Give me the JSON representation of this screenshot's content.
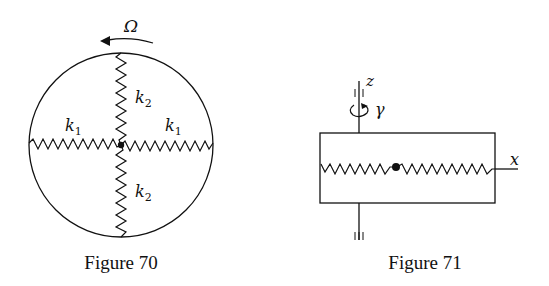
{
  "figures": [
    {
      "id": "fig70",
      "caption": "Figure 70",
      "labels": {
        "rotation": "Ω",
        "spring_top": "k",
        "spring_top_sub": "2",
        "spring_bottom": "k",
        "spring_bottom_sub": "2",
        "spring_left": "k",
        "spring_left_sub": "1",
        "spring_right": "k",
        "spring_right_sub": "1"
      },
      "description": "Circle rotating with angular velocity Ω containing a central mass attached by four springs: k1 horizontal (left and right), k2 vertical (top and bottom)"
    },
    {
      "id": "fig71",
      "caption": "Figure 71",
      "labels": {
        "axis_z": "z",
        "axis_x": "x",
        "rotation": "γ"
      },
      "description": "Rectangular frame rotating about vertical z axis with rate γ; mass on springs along x axis"
    }
  ],
  "colors": {
    "ink": "#111111",
    "background": "#ffffff"
  }
}
